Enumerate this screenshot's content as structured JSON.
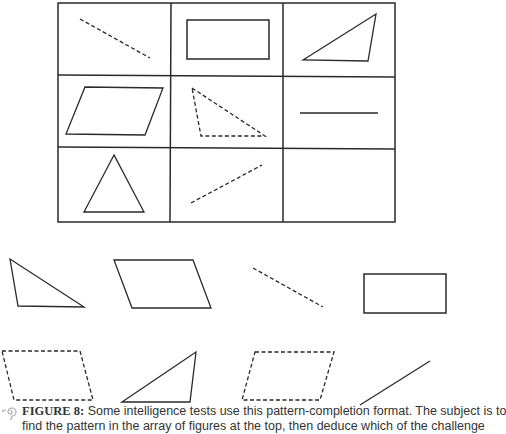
{
  "figure": {
    "label": "FIGURE 8:",
    "caption_line1": "Some intelligence tests use this pattern-completion format. The subject is to",
    "caption_line2": "find the pattern in the array of figures at the top, then deduce which of the challenge"
  },
  "matrix": {
    "rows": 3,
    "cols": 3,
    "cells": [
      [
        "dashed line (descending)",
        "solid rectangle",
        "solid triangle"
      ],
      [
        "solid parallelogram",
        "dashed triangle",
        "solid line (horizontal)"
      ],
      [
        "solid triangle (isosceles)",
        "dashed line (ascending)",
        "empty"
      ]
    ]
  },
  "options": {
    "row1": [
      "solid right triangle",
      "solid parallelogram",
      "dashed line",
      "solid rectangle"
    ],
    "row2": [
      "dashed parallelogram",
      "solid triangle",
      "dashed parallelogram",
      "solid line"
    ]
  },
  "colors": {
    "stroke": "#333333",
    "caption": "#333333"
  }
}
